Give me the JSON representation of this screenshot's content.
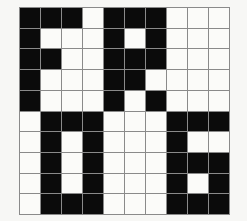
{
  "figure": {
    "type": "pixel-grid",
    "rows": 10,
    "cols": 10,
    "colors": {
      "filled": "#0b0b0b",
      "empty": "#fbfbf9",
      "gridline": "#8a8a8a",
      "background": "#f7f7f5"
    },
    "legend": {
      "filled_label": "1",
      "empty_label": "0"
    },
    "grid": [
      [
        1,
        1,
        1,
        0,
        1,
        1,
        1,
        0,
        0,
        0
      ],
      [
        1,
        0,
        0,
        0,
        1,
        0,
        1,
        0,
        0,
        0
      ],
      [
        1,
        1,
        0,
        0,
        1,
        1,
        1,
        0,
        0,
        0
      ],
      [
        1,
        0,
        0,
        0,
        1,
        1,
        0,
        0,
        0,
        0
      ],
      [
        1,
        0,
        0,
        0,
        1,
        0,
        1,
        0,
        0,
        0
      ],
      [
        0,
        1,
        1,
        1,
        0,
        0,
        0,
        1,
        1,
        1
      ],
      [
        0,
        1,
        0,
        1,
        0,
        0,
        0,
        1,
        0,
        0
      ],
      [
        0,
        1,
        0,
        1,
        0,
        0,
        0,
        1,
        1,
        1
      ],
      [
        0,
        1,
        0,
        1,
        0,
        0,
        0,
        1,
        0,
        1
      ],
      [
        0,
        1,
        1,
        1,
        0,
        0,
        0,
        1,
        1,
        1
      ]
    ]
  }
}
